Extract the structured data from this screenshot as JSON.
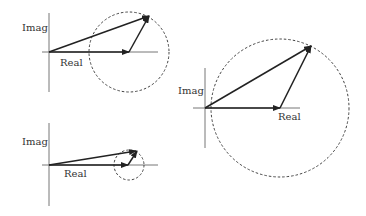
{
  "colors": {
    "line": "#222222",
    "axis": "#666666",
    "circle": "#444444",
    "background": "#ffffff"
  },
  "diagrams": [
    {
      "id": "top-left",
      "labels": {
        "imag": "Imag",
        "real": "Real"
      },
      "axis": {
        "x": 49,
        "y": 52,
        "y_top": 13,
        "y_bottom": 92,
        "x_left": 42,
        "x_right": 158
      },
      "real_vector": {
        "x1": 49,
        "y1": 52,
        "x2": 129,
        "y2": 52
      },
      "rotating_vector": {
        "x1": 129,
        "y1": 52,
        "x2": 149,
        "y2": 16
      },
      "resultant": {
        "x1": 49,
        "y1": 52,
        "x2": 149,
        "y2": 16
      },
      "circle": {
        "cx": 129,
        "cy": 52,
        "r": 40
      }
    },
    {
      "id": "bottom-left",
      "labels": {
        "imag": "Imag",
        "real": "Real"
      },
      "axis": {
        "x": 49,
        "y": 165,
        "y_top": 123,
        "y_bottom": 206,
        "x_left": 42,
        "x_right": 158
      },
      "real_vector": {
        "x1": 49,
        "y1": 165,
        "x2": 128,
        "y2": 165
      },
      "rotating_vector": {
        "x1": 128,
        "y1": 165,
        "x2": 137,
        "y2": 151
      },
      "resultant": {
        "x1": 49,
        "y1": 165,
        "x2": 136,
        "y2": 151
      },
      "circle": {
        "cx": 129,
        "cy": 165,
        "r": 15
      }
    },
    {
      "id": "right",
      "labels": {
        "imag": "Imag",
        "real": "Real"
      },
      "axis": {
        "x": 205,
        "y": 108,
        "y_top": 68,
        "y_bottom": 148,
        "x_left": 193,
        "x_right": 300
      },
      "real_vector": {
        "x1": 205,
        "y1": 108,
        "x2": 280,
        "y2": 108
      },
      "rotating_vector": {
        "x1": 280,
        "y1": 108,
        "x2": 311,
        "y2": 46
      },
      "resultant": {
        "x1": 205,
        "y1": 108,
        "x2": 311,
        "y2": 46
      },
      "circle": {
        "cx": 280,
        "cy": 108,
        "r": 69
      }
    }
  ]
}
